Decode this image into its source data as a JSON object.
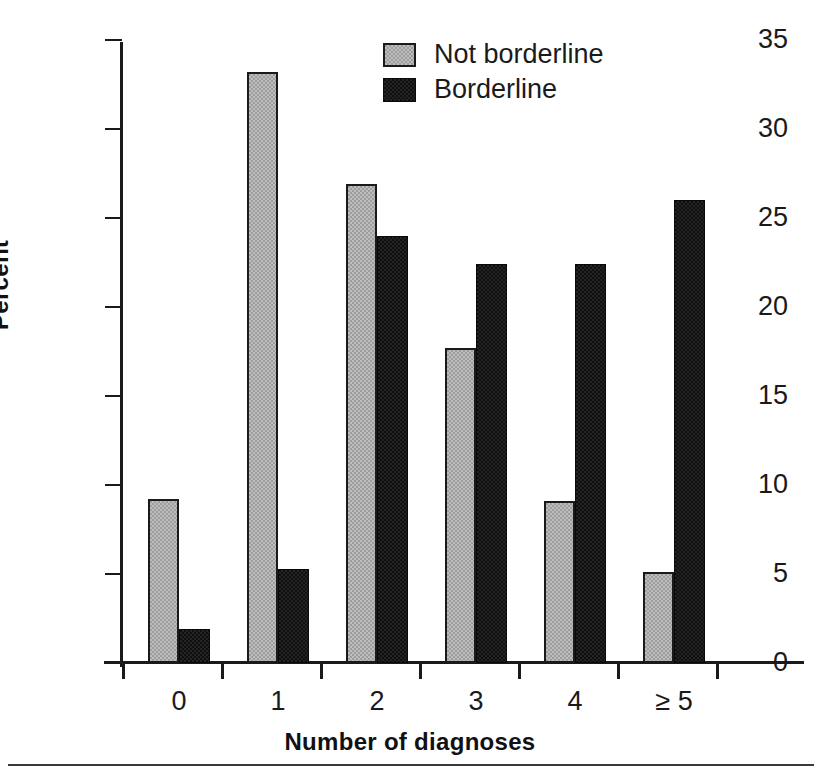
{
  "chart_data": {
    "type": "bar",
    "title": "",
    "xlabel": "Number of diagnoses",
    "ylabel": "Percent",
    "categories": [
      "0",
      "1",
      "2",
      "3",
      "4",
      "≥ 5"
    ],
    "series": [
      {
        "name": "Not borderline",
        "color": "#9d9d9d",
        "values": [
          9.2,
          33.2,
          26.9,
          17.7,
          9.1,
          5.1
        ]
      },
      {
        "name": "Borderline",
        "color": "#100f0f",
        "values": [
          1.9,
          5.3,
          24.0,
          22.4,
          22.4,
          26.0
        ]
      }
    ],
    "ylim": [
      0,
      35
    ],
    "yticks": [
      0,
      5,
      10,
      15,
      20,
      25,
      30,
      35
    ],
    "ytick_labels": [
      "0",
      "5",
      "10",
      "15",
      "20",
      "25",
      "30",
      "35"
    ],
    "grid": false,
    "legend_position": "top-center"
  },
  "legend": {
    "entries": [
      {
        "label": "Not borderline"
      },
      {
        "label": "Borderline"
      }
    ]
  },
  "axes": {
    "y_title": "Percent",
    "x_title": "Number of diagnoses"
  }
}
